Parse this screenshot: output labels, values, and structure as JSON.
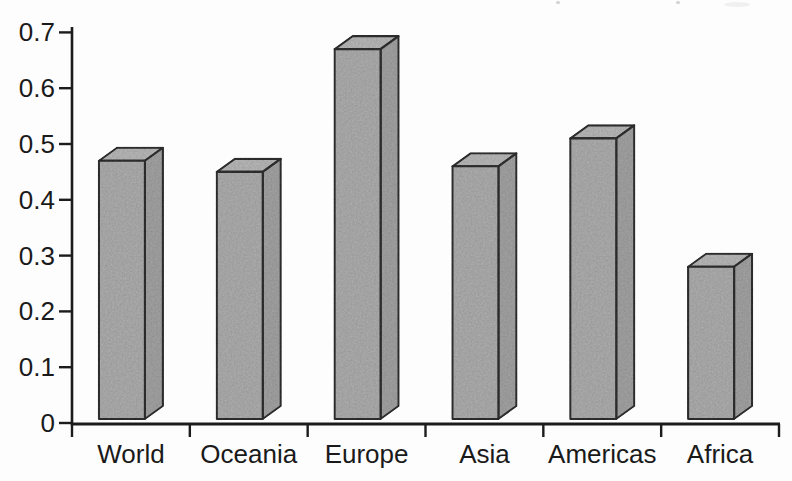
{
  "chart_data": {
    "type": "bar",
    "variant": "3d-column",
    "title": "",
    "categories": [
      "World",
      "Oceania",
      "Europe",
      "Asia",
      "Americas",
      "Africa"
    ],
    "values": [
      0.47,
      0.45,
      0.67,
      0.46,
      0.51,
      0.28
    ],
    "xlabel": "",
    "ylabel": "",
    "ylim": [
      0,
      0.7
    ],
    "ytick_interval": 0.1,
    "ytick_labels": [
      "0",
      "0.1",
      "0.2",
      "0.3",
      "0.4",
      "0.5",
      "0.6",
      "0.7"
    ],
    "grid": false,
    "legend": false,
    "colors": {
      "background": "#fdfdfd",
      "bar_front": "#b1b1b1",
      "bar_top": "#bcbcbc",
      "bar_side": "#a6a6a6",
      "edge": "#222222",
      "axis": "#1c1c1c",
      "label_text": "#1a1a1a"
    }
  }
}
